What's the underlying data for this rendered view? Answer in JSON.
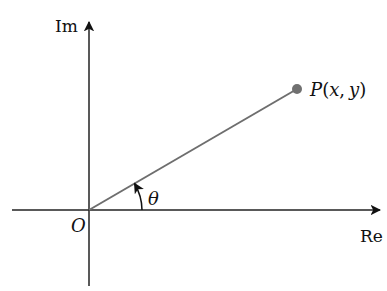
{
  "diagram": {
    "title": "",
    "axes": {
      "x_label": "Re",
      "y_label": "Im",
      "origin_label": "O"
    },
    "point": {
      "label": "P(x, y)",
      "label_parts": {
        "name": "P",
        "open": "(",
        "x": "x",
        "comma": ",",
        "y": "y",
        "close": ")"
      }
    },
    "angle_label": "θ",
    "colors": {
      "axis": "#111111",
      "vector": "#6e6e6e",
      "point": "#707070",
      "text": "#111111"
    }
  }
}
